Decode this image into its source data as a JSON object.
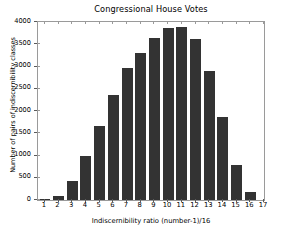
{
  "chart_data": {
    "type": "bar",
    "title": "Congressional House Votes",
    "xlabel": "Indiscernibility ratio (number-1)/16",
    "ylabel": "Number of pairs of indiscernibility classes",
    "categories": [
      "1",
      "2",
      "3",
      "4",
      "5",
      "6",
      "7",
      "8",
      "9",
      "10",
      "11",
      "12",
      "13",
      "14",
      "15",
      "16"
    ],
    "values": [
      20,
      90,
      420,
      980,
      1660,
      2360,
      2960,
      3310,
      3650,
      3870,
      3880,
      3620,
      2910,
      1870,
      780,
      170
    ],
    "xlim": [
      0.5,
      17
    ],
    "ylim": [
      0,
      4000
    ],
    "xticks": [
      "1",
      "2",
      "3",
      "4",
      "5",
      "6",
      "7",
      "8",
      "9",
      "10",
      "11",
      "12",
      "13",
      "14",
      "15",
      "16",
      "17"
    ],
    "yticks": [
      "0",
      "500",
      "1000",
      "1500",
      "2000",
      "2500",
      "3000",
      "3500",
      "4000"
    ],
    "ytick_values": [
      0,
      500,
      1000,
      1500,
      2000,
      2500,
      3000,
      3500,
      4000
    ],
    "grid": false,
    "legend": "none",
    "bar_color": "#333333",
    "background_color": "#ffffff",
    "axis_color": "#9a9a9a"
  }
}
